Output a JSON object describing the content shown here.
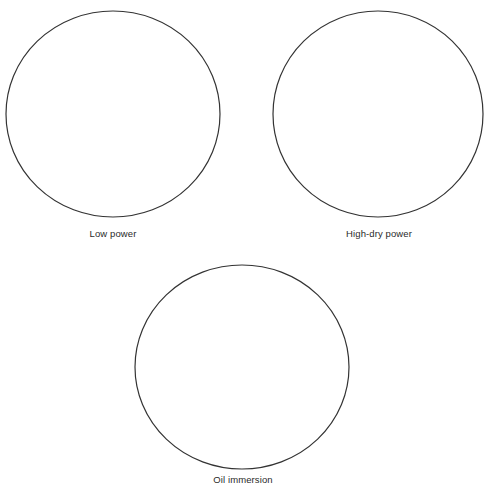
{
  "diagram": {
    "type": "microscope-fields-of-view",
    "stroke_color": "#333333",
    "background": "#ffffff",
    "fields": [
      {
        "label": "Low power",
        "cx": 113,
        "cy": 114,
        "rx": 107,
        "ry": 103,
        "label_x": 113,
        "label_y": 232
      },
      {
        "label": "High-dry power",
        "cx": 378,
        "cy": 114,
        "rx": 105,
        "ry": 103,
        "label_x": 379,
        "label_y": 227
      },
      {
        "label": "Oil immersion",
        "cx": 242,
        "cy": 367,
        "rx": 107,
        "ry": 102,
        "label_x": 243,
        "label_y": 476
      }
    ]
  }
}
